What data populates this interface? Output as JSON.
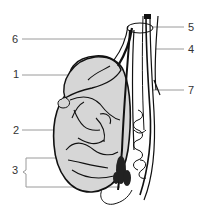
{
  "diagram": {
    "colors": {
      "background": "#ffffff",
      "outline": "#111111",
      "testis_fill": "#d6d6d6",
      "leader_line": "#9a9a9a",
      "label_text": "#333333"
    },
    "labels": {
      "left": [
        {
          "id": "6",
          "text": "6",
          "x": 12,
          "y": 34,
          "line_y": 39,
          "line_x1": 22,
          "line_x2": 125
        },
        {
          "id": "1",
          "text": "1",
          "x": 13,
          "y": 69,
          "line_y": 75,
          "line_x1": 22,
          "line_x2": 78
        },
        {
          "id": "2",
          "text": "2",
          "x": 13,
          "y": 125,
          "line_y": 130,
          "line_x1": 22,
          "line_x2": 86
        },
        {
          "id": "3",
          "text": "3",
          "x": 12,
          "y": 165,
          "brace_top": 158,
          "brace_bottom": 187
        }
      ],
      "right": [
        {
          "id": "5",
          "text": "5",
          "x": 188,
          "y": 22,
          "line_y": 27,
          "line_x1": 152,
          "line_x2": 184
        },
        {
          "id": "4",
          "text": "4",
          "x": 188,
          "y": 44,
          "line_y": 49,
          "line_x1": 156,
          "line_x2": 184
        },
        {
          "id": "7",
          "text": "7",
          "x": 188,
          "y": 85,
          "line_y": 90,
          "line_x1": 153,
          "line_x2": 184
        }
      ]
    }
  }
}
